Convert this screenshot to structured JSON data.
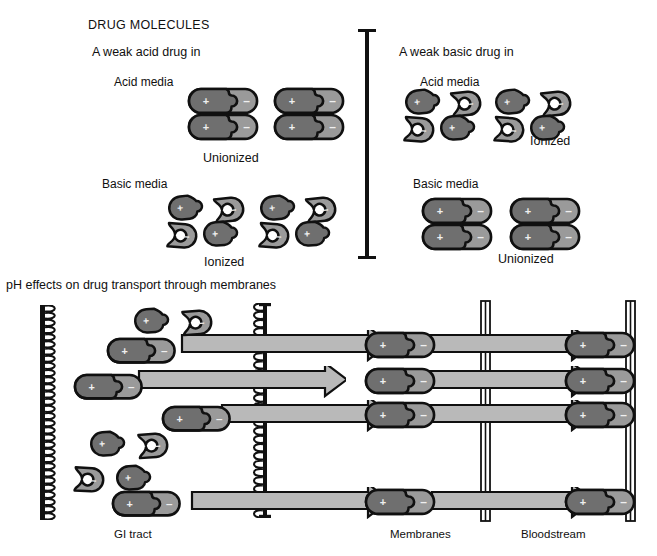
{
  "figure": {
    "title": "DRUG MOLECULES",
    "lower_title": "pH effects on drug transport through membranes"
  },
  "panels": {
    "left": {
      "heading": "A weak acid drug in",
      "acid_media_label": "Acid media",
      "acid_state": "Unionized",
      "basic_media_label": "Basic media",
      "basic_state": "Ionized"
    },
    "right": {
      "heading": "A weak basic drug in",
      "acid_media_label": "Acid media",
      "acid_state": "Ionized",
      "basic_media_label": "Basic media",
      "basic_state": "Unionized"
    }
  },
  "transport": {
    "compartments": {
      "gi_tract": "GI tract",
      "membranes": "Membranes",
      "bloodstream": "Bloodstream"
    }
  },
  "symbols": {
    "plus": "+",
    "minus": "–"
  },
  "colors": {
    "outline": "#101010",
    "plus_fill": "#6f6f6f",
    "minus_fill": "#9a9a9a",
    "arrow_fill": "#b9b9b9",
    "wall_fill": "#ffffff",
    "background": "#ffffff"
  }
}
